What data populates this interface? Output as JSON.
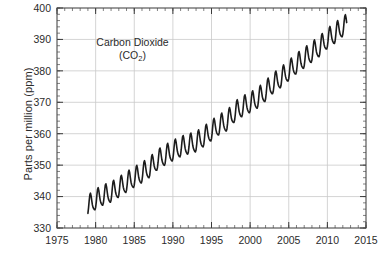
{
  "chart_data": {
    "type": "line",
    "title": "Carbon Dioxide",
    "title_line2_pre": "(CO",
    "title_line2_sub": "2",
    "title_line2_post": ")",
    "xlabel": "",
    "ylabel": "Parts per million (ppm)",
    "xlim": [
      1975,
      2015
    ],
    "ylim": [
      330,
      400
    ],
    "x_major_ticks": [
      1975,
      1980,
      1985,
      1990,
      1995,
      2000,
      2005,
      2010,
      2015
    ],
    "x_tick_labels": [
      "1975",
      "1980",
      "1985",
      "1990",
      "1995",
      "2000",
      "2005",
      "2010",
      "2015"
    ],
    "x_minor_step": 1,
    "y_major_ticks": [
      330,
      340,
      350,
      360,
      370,
      380,
      390,
      400
    ],
    "y_tick_labels": [
      "330",
      "340",
      "350",
      "360",
      "370",
      "380",
      "390",
      "400"
    ],
    "y_minor_step": 2,
    "grid": true,
    "grid_color": "#c9c9c9",
    "legend": null,
    "series": [
      {
        "name": "Atmospheric CO2 (monthly mean)",
        "color": "#1c1c1c",
        "line_width": 1.6,
        "x_start": 1979.0,
        "x_end": 2012.5,
        "sample_step_years": 0.08333,
        "seasonal_amplitude_ppm": 3.1,
        "seasonal_peak_month": 5,
        "trend_anchors": [
          {
            "x": 1979.0,
            "y": 336.8
          },
          {
            "x": 1980.0,
            "y": 338.7
          },
          {
            "x": 1981.0,
            "y": 340.1
          },
          {
            "x": 1982.0,
            "y": 341.0
          },
          {
            "x": 1983.0,
            "y": 342.6
          },
          {
            "x": 1984.0,
            "y": 344.2
          },
          {
            "x": 1985.0,
            "y": 345.8
          },
          {
            "x": 1986.0,
            "y": 347.2
          },
          {
            "x": 1987.0,
            "y": 348.9
          },
          {
            "x": 1988.0,
            "y": 351.3
          },
          {
            "x": 1989.0,
            "y": 352.8
          },
          {
            "x": 1990.0,
            "y": 354.2
          },
          {
            "x": 1991.0,
            "y": 355.5
          },
          {
            "x": 1992.0,
            "y": 356.3
          },
          {
            "x": 1993.0,
            "y": 357.0
          },
          {
            "x": 1994.0,
            "y": 358.7
          },
          {
            "x": 1995.0,
            "y": 360.6
          },
          {
            "x": 1996.0,
            "y": 362.5
          },
          {
            "x": 1997.0,
            "y": 363.7
          },
          {
            "x": 1998.0,
            "y": 366.6
          },
          {
            "x": 1999.0,
            "y": 368.3
          },
          {
            "x": 2000.0,
            "y": 369.5
          },
          {
            "x": 2001.0,
            "y": 371.0
          },
          {
            "x": 2002.0,
            "y": 373.2
          },
          {
            "x": 2003.0,
            "y": 375.7
          },
          {
            "x": 2004.0,
            "y": 377.5
          },
          {
            "x": 2005.0,
            "y": 379.7
          },
          {
            "x": 2006.0,
            "y": 381.9
          },
          {
            "x": 2007.0,
            "y": 383.7
          },
          {
            "x": 2008.0,
            "y": 385.6
          },
          {
            "x": 2009.0,
            "y": 387.4
          },
          {
            "x": 2010.0,
            "y": 389.9
          },
          {
            "x": 2011.0,
            "y": 391.6
          },
          {
            "x": 2012.0,
            "y": 393.8
          },
          {
            "x": 2012.5,
            "y": 394.4
          }
        ]
      }
    ]
  }
}
